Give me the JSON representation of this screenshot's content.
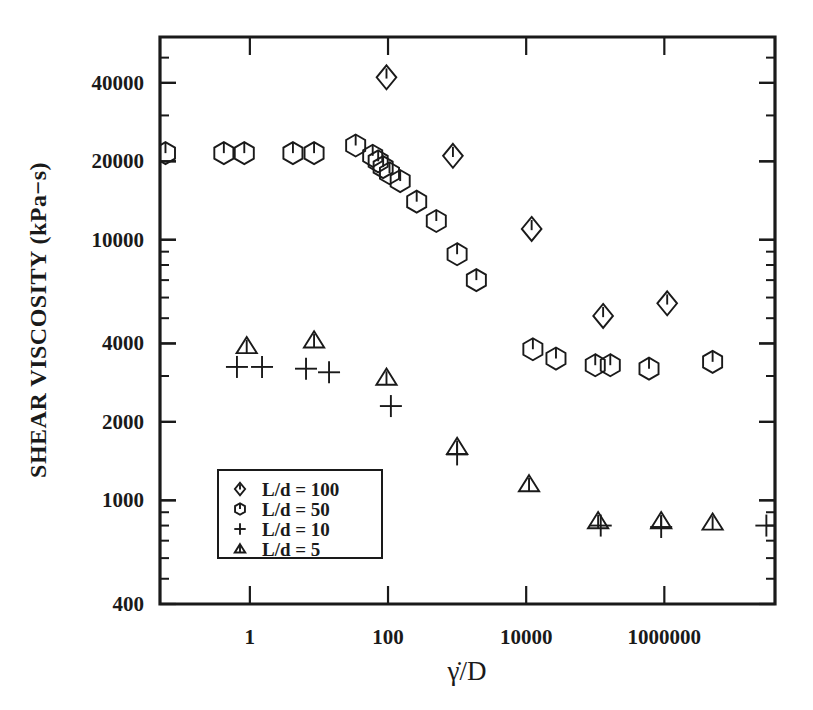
{
  "chart_data": {
    "type": "scatter",
    "title": "",
    "xlabel": "γ̇/D",
    "ylabel": "SHEAR VISCOSITY (kPa−s)",
    "xscale": "log",
    "yscale": "log",
    "xlim": [
      0.05,
      40000000
    ],
    "ylim": [
      400,
      60000
    ],
    "grid": false,
    "legend_position": "lower-left-inside",
    "xticks": [
      {
        "value": 1,
        "label": "1"
      },
      {
        "value": 100,
        "label": "100"
      },
      {
        "value": 10000,
        "label": "10000"
      },
      {
        "value": 1000000,
        "label": "1000000"
      }
    ],
    "yticks": [
      {
        "value": 40000,
        "label": "40000"
      },
      {
        "value": 20000,
        "label": "20000"
      },
      {
        "value": 10000,
        "label": "10000"
      },
      {
        "value": 4000,
        "label": "4000"
      },
      {
        "value": 2000,
        "label": "2000"
      },
      {
        "value": 1000,
        "label": "1000"
      },
      {
        "value": 400,
        "label": "400"
      }
    ],
    "series": [
      {
        "name": "L/d = 100",
        "label": "L/d  =  100",
        "marker": "diamond",
        "points": [
          {
            "x": 95,
            "y": 42000
          },
          {
            "x": 870,
            "y": 21000
          },
          {
            "x": 12000,
            "y": 11000
          },
          {
            "x": 130000,
            "y": 5100
          },
          {
            "x": 1100000,
            "y": 5700
          }
        ]
      },
      {
        "name": "L/d = 50",
        "label": "L/d  =  50",
        "marker": "hexagon",
        "points": [
          {
            "x": 0.06,
            "y": 21500
          },
          {
            "x": 0.42,
            "y": 21500
          },
          {
            "x": 0.83,
            "y": 21500
          },
          {
            "x": 4.2,
            "y": 21500
          },
          {
            "x": 8.5,
            "y": 21500
          },
          {
            "x": 34,
            "y": 23000
          },
          {
            "x": 60,
            "y": 21000
          },
          {
            "x": 72,
            "y": 20000
          },
          {
            "x": 85,
            "y": 19000
          },
          {
            "x": 105,
            "y": 18000
          },
          {
            "x": 150,
            "y": 16800
          },
          {
            "x": 260,
            "y": 14000
          },
          {
            "x": 500,
            "y": 11800
          },
          {
            "x": 1000,
            "y": 8800
          },
          {
            "x": 1900,
            "y": 7000
          },
          {
            "x": 12500,
            "y": 3800
          },
          {
            "x": 27000,
            "y": 3500
          },
          {
            "x": 100000,
            "y": 3300
          },
          {
            "x": 165000,
            "y": 3300
          },
          {
            "x": 600000,
            "y": 3200
          },
          {
            "x": 5000000,
            "y": 3400
          }
        ]
      },
      {
        "name": "L/d = 10",
        "label": "L/d  =  10",
        "marker": "plus",
        "points": [
          {
            "x": 0.65,
            "y": 3250
          },
          {
            "x": 1.5,
            "y": 3250
          },
          {
            "x": 6.5,
            "y": 3200
          },
          {
            "x": 14,
            "y": 3100
          },
          {
            "x": 110,
            "y": 2300
          },
          {
            "x": 1000,
            "y": 1500
          },
          {
            "x": 120000,
            "y": 800
          },
          {
            "x": 900000,
            "y": 790
          },
          {
            "x": 30000000,
            "y": 800
          }
        ]
      },
      {
        "name": "L/d = 5",
        "label": "L/d  =  5",
        "marker": "triangle",
        "points": [
          {
            "x": 0.9,
            "y": 3900
          },
          {
            "x": 8.5,
            "y": 4100
          },
          {
            "x": 95,
            "y": 2950
          },
          {
            "x": 1000,
            "y": 1600
          },
          {
            "x": 11000,
            "y": 1150
          },
          {
            "x": 110000,
            "y": 830
          },
          {
            "x": 900000,
            "y": 830
          },
          {
            "x": 5000000,
            "y": 820
          }
        ]
      }
    ]
  },
  "legend": {
    "items": [
      {
        "marker": "diamond",
        "label": "L/d  =  100"
      },
      {
        "marker": "hexagon",
        "label": "L/d  =  50"
      },
      {
        "marker": "plus",
        "label": "L/d  =  10"
      },
      {
        "marker": "triangle",
        "label": "L/d  =  5"
      }
    ]
  }
}
